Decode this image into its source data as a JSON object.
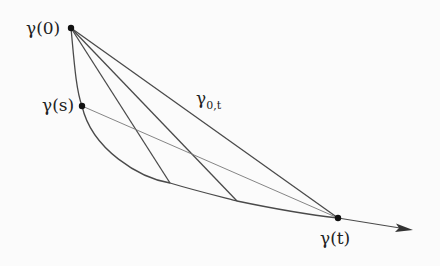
{
  "diagram": {
    "labels": {
      "gamma0": "γ(0)",
      "gammaS": "γ(s)",
      "gammaT": "γ(t)",
      "gamma0t_main": "γ",
      "gamma0t_sub": "0,t"
    },
    "points": {
      "gamma0": [
        71,
        28
      ],
      "gammaS": [
        82,
        106
      ],
      "gammaT": [
        338,
        218
      ],
      "arrow_tip": [
        413,
        230
      ]
    },
    "colors": {
      "stroke": "#4a4a4a",
      "thin_stroke": "#777777",
      "dot": "#111111"
    }
  }
}
